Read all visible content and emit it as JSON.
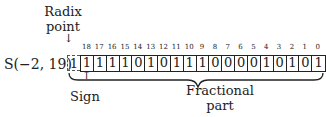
{
  "diagram": {
    "format_label": "S(−2, 19)",
    "radix_label_line1": "Radix",
    "radix_label_line2": "point",
    "down_arrow": "↓",
    "up_arrow": "↑",
    "leading_bit": "1",
    "bit_indices": [
      "18",
      "17",
      "16",
      "15",
      "14",
      "13",
      "12",
      "11",
      "10",
      "9",
      "8",
      "7",
      "6",
      "5",
      "4",
      "3",
      "2",
      "1",
      "0"
    ],
    "bits": [
      "1",
      "1",
      "1",
      "1",
      "0",
      "1",
      "0",
      "1",
      "1",
      "1",
      "0",
      "0",
      "0",
      "0",
      "1",
      "0",
      "1",
      "0",
      "1"
    ],
    "sign_label": "Sign",
    "fractional_label_line1": "Fractional",
    "fractional_label_line2": "part"
  }
}
